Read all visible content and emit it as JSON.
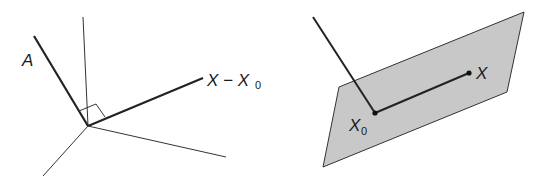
{
  "left_figure": {
    "labels": {
      "normal_vector": "A",
      "difference_vector": "X − X",
      "difference_subscript": "0"
    }
  },
  "right_figure": {
    "labels": {
      "point_x": "X",
      "point_x0": "X",
      "point_x0_subscript": "0"
    },
    "plane_fill": "#c8c8c8"
  }
}
